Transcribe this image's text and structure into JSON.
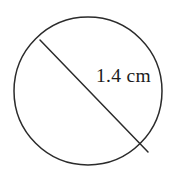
{
  "figure": {
    "type": "geometry-diagram",
    "background_color": "#ffffff",
    "stroke_color": "#2b2b2b",
    "text_color": "#1c1c1c",
    "canvas": {
      "width": 175,
      "height": 179
    },
    "shapes": {
      "circle": {
        "name": "circle-outline",
        "cx": 88,
        "cy": 91,
        "r": 74,
        "stroke_width": 1.5,
        "fill": "none"
      },
      "diameter": {
        "name": "diameter-segment",
        "x1": 40,
        "y1": 40,
        "x2": 148,
        "y2": 152,
        "stroke_width": 1.5
      }
    },
    "labels": {
      "diameter_measure": "1.4 cm",
      "value": 1.4,
      "unit": "cm"
    }
  }
}
